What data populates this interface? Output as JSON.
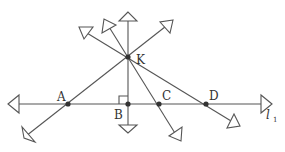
{
  "diagram": {
    "points": {
      "K": {
        "label": "K",
        "x": 128,
        "y": 57
      },
      "A": {
        "label": "A",
        "x": 68,
        "y": 104
      },
      "B": {
        "label": "B",
        "x": 128,
        "y": 104
      },
      "C": {
        "label": "C",
        "x": 159,
        "y": 104
      },
      "D": {
        "label": "D",
        "x": 206,
        "y": 104
      }
    },
    "line_label": {
      "main": "l",
      "sub": "1"
    },
    "right_angle_at": "B",
    "colors": {
      "stroke": "#555555",
      "point": "#333333",
      "background": "#ffffff"
    }
  }
}
